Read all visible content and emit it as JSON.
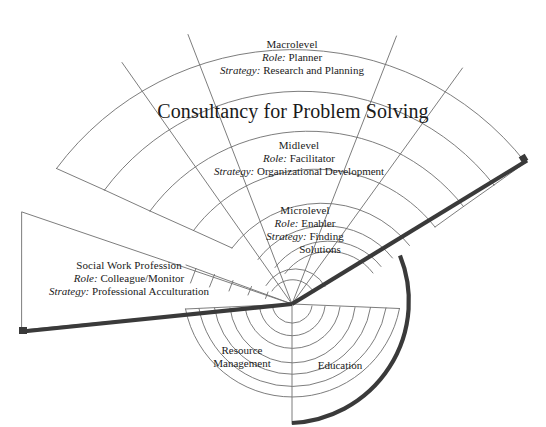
{
  "diagram": {
    "title": "Consultancy for Problem Solving",
    "type": "concentric-fan",
    "center": {
      "x": 292,
      "y": 304
    },
    "colors": {
      "line": "#6e6e6e",
      "bold_line": "#3a3a3a",
      "text": "#1a1a1a",
      "background": "#ffffff"
    },
    "tiers": [
      {
        "id": "macrolevel",
        "heading": "Macrolevel",
        "role_label": "Role:",
        "role_value": "Planner",
        "strategy_label": "Strategy:",
        "strategy_value": "Research and Planning"
      },
      {
        "id": "midlevel",
        "heading": "Midlevel",
        "role_label": "Role:",
        "role_value": "Facilitator",
        "strategy_label": "Strategy:",
        "strategy_value": "Organizational Development"
      },
      {
        "id": "microlevel",
        "heading": "Microlevel",
        "role_label": "Role:",
        "role_value": "Enabler",
        "strategy_label": "Strategy:",
        "strategy_value": "Finding",
        "strategy_value_line2": "Solutions"
      },
      {
        "id": "social-work-profession",
        "heading": "Social Work Profession",
        "role_label": "Role:",
        "role_value": "Colleague/Monitor",
        "strategy_label": "Strategy:",
        "strategy_value": "Professional Acculturation"
      }
    ],
    "bottom_labels": [
      {
        "id": "resource-management",
        "line1": "Resource",
        "line2": "Management"
      },
      {
        "id": "education",
        "line1": "Education",
        "line2": ""
      }
    ]
  }
}
